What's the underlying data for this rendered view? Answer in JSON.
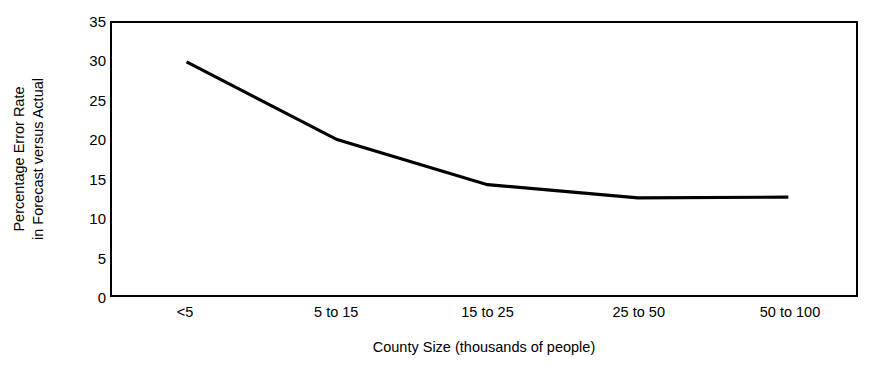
{
  "chart_data": {
    "type": "line",
    "title": "",
    "subtitle": "",
    "xlabel": "County Size (thousands of people)",
    "ylabel": "Percentage Error Rate in Forecast versus Actual",
    "ylabel_lines": [
      "Percentage Error Rate",
      "in Forecast versus Actual"
    ],
    "categories": [
      "<5",
      "5 to 15",
      "15 to 25",
      "25 to 50",
      "50 to 100"
    ],
    "values": [
      30,
      20,
      14.2,
      12.5,
      12.6
    ],
    "series": [
      {
        "name": "Percentage Error Rate",
        "values": [
          30,
          20,
          14.2,
          12.5,
          12.6
        ]
      }
    ],
    "ylim": [
      0,
      35
    ],
    "yticks": [
      0,
      5,
      10,
      15,
      20,
      25,
      30,
      35
    ],
    "ytick_labels": [
      "0",
      "5",
      "10",
      "15",
      "20",
      "25",
      "30",
      "35"
    ],
    "grid": false,
    "legend": "none",
    "markers": false,
    "line_color": "#000000",
    "line_width": 3.2,
    "background_color": "#ffffff",
    "frame_color": "#000000"
  }
}
